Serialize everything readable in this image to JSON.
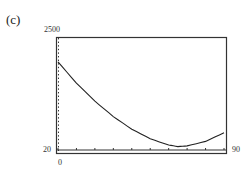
{
  "panel_label": "(c)",
  "chart_data": {
    "type": "line",
    "title": "",
    "xlabel": "",
    "ylabel": "",
    "xlim": [
      0,
      90
    ],
    "ylim": [
      20,
      2500
    ],
    "x_tick_labels": {
      "min": "0",
      "max": "90"
    },
    "y_tick_labels": {
      "min": "20",
      "max": "2500"
    },
    "grid": false,
    "x": [
      0,
      10,
      20,
      30,
      40,
      50,
      60,
      65,
      70,
      80,
      90
    ],
    "values": [
      1970,
      1500,
      1100,
      760,
      480,
      270,
      130,
      95,
      110,
      210,
      400
    ]
  },
  "axes": {
    "x_min_label": "0",
    "x_max_label": "90",
    "y_min_label": "20",
    "y_max_label": "2500"
  }
}
